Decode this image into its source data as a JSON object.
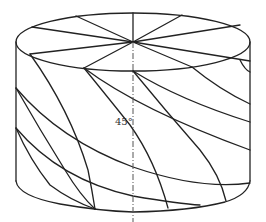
{
  "figure": {
    "type": "cylinder-helical-winding-diagram",
    "angle_label": "45°",
    "top_radial_line_count": 10,
    "colors": {
      "stroke": "#222222",
      "axis": "#555555",
      "background": "#ffffff"
    }
  }
}
